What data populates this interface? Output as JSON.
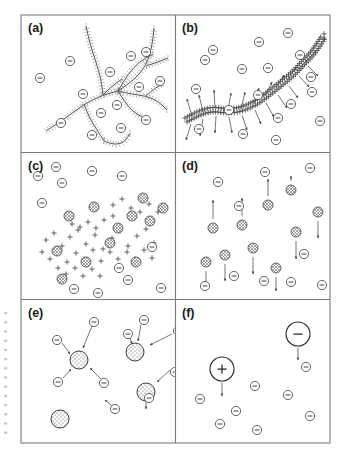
{
  "figure": {
    "name": "polyelectrolyte-complexation-schematic",
    "width": 350,
    "height": 457,
    "background_color": "#ffffff",
    "frame_color": "#7a7a7a",
    "ink_color": "#3a3a3a"
  },
  "layout": {
    "grid": {
      "columns": 2,
      "rows": 3
    },
    "frame": {
      "x": 21,
      "y": 15,
      "width": 309,
      "height": 428
    },
    "divider_x": 175.5,
    "divider_y1": 152.5,
    "divider_y2": 299.5,
    "panel_boxes": [
      {
        "id": "a",
        "x": 21,
        "y": 15,
        "width": 154.5,
        "height": 137.5
      },
      {
        "id": "b",
        "x": 175.5,
        "y": 15,
        "width": 154.5,
        "height": 137.5
      },
      {
        "id": "c",
        "x": 21,
        "y": 152.5,
        "width": 154.5,
        "height": 147
      },
      {
        "id": "d",
        "x": 175.5,
        "y": 152.5,
        "width": 154.5,
        "height": 147
      },
      {
        "id": "e",
        "x": 21,
        "y": 299.5,
        "width": 154.5,
        "height": 143.5
      },
      {
        "id": "f",
        "x": 175.5,
        "y": 299.5,
        "width": 154.5,
        "height": 143.5
      }
    ]
  },
  "panels": [
    {
      "id": "a",
      "label": "(a)",
      "label_x": 28,
      "label_y": 32,
      "description": "branched polyelectrolyte network with charged side groups, surrounded by free negative counterions",
      "content_type": "branched-network"
    },
    {
      "id": "b",
      "label": "(b)",
      "label_x": 182,
      "label_y": 32,
      "description": "single extended chain densely decorated with positive charges, arrows indicating counterion attraction, negative ions in solution",
      "content_type": "extended-chain-with-arrows"
    },
    {
      "id": "c",
      "label": "(c)",
      "label_x": 28,
      "label_y": 170,
      "description": "fragmented chain breaking into charged segments with partially formed complexes and free negative ions",
      "content_type": "fragmenting-cluster"
    },
    {
      "id": "d",
      "label": "(d)",
      "label_x": 182,
      "label_y": 170,
      "description": "dispersed neutral complexes each carrying a vertical migration arrow, with remaining free negative ions",
      "content_type": "dispersed-complexes"
    },
    {
      "id": "e",
      "label": "(e)",
      "label_x": 28,
      "label_y": 317,
      "description": "large stippled colloidal complexes attracting negative counterions along radial arrows",
      "content_type": "colloid-attraction"
    },
    {
      "id": "f",
      "label": "(f)",
      "label_x": 182,
      "label_y": 317,
      "description": "isolated large positive and large negative macroions each with a downward sedimentation arrow among free negative ions",
      "content_type": "macroion-sedimentation"
    }
  ],
  "glyphs": {
    "negative_ion": {
      "symbol": "minus-in-circle",
      "radius": 4.6,
      "label": "⊖"
    },
    "positive_charge": {
      "symbol": "plus-mark",
      "size": 2.6,
      "label": "+"
    },
    "complex_particle": {
      "symbol": "hatched-circle",
      "radius": 5.0
    },
    "colloid_particle": {
      "symbol": "stippled-circle",
      "radius": 9.0
    },
    "macroion_positive": {
      "symbol": "large-circle-plus",
      "radius": 12.0,
      "label": "+"
    },
    "macroion_negative": {
      "symbol": "large-circle-minus",
      "radius": 12.0,
      "label": "−"
    }
  },
  "geometry": {
    "a_ions": [
      [
        40,
        78
      ],
      [
        70,
        61
      ],
      [
        83,
        94
      ],
      [
        110,
        72
      ],
      [
        131,
        56
      ],
      [
        117,
        105
      ],
      [
        146,
        52
      ],
      [
        139,
        87
      ],
      [
        160,
        81
      ],
      [
        121,
        128
      ],
      [
        61,
        123
      ],
      [
        146,
        120
      ],
      [
        101,
        113
      ],
      [
        92,
        135
      ]
    ],
    "a_branches": [
      [
        [
          46,
          131
        ],
        [
          66,
          118
        ],
        [
          84,
          104
        ],
        [
          103,
          95
        ],
        [
          118,
          91
        ]
      ],
      [
        [
          118,
          91
        ],
        [
          134,
          80
        ],
        [
          146,
          66
        ],
        [
          152,
          47
        ],
        [
          154,
          28
        ]
      ],
      [
        [
          118,
          91
        ],
        [
          131,
          94
        ],
        [
          146,
          96
        ],
        [
          158,
          101
        ],
        [
          167,
          110
        ]
      ],
      [
        [
          103,
          95
        ],
        [
          101,
          79
        ],
        [
          96,
          62
        ],
        [
          90,
          44
        ],
        [
          86,
          26
        ]
      ],
      [
        [
          118,
          91
        ],
        [
          128,
          74
        ],
        [
          140,
          61
        ],
        [
          153,
          54
        ]
      ],
      [
        [
          84,
          104
        ],
        [
          89,
          117
        ],
        [
          97,
          130
        ],
        [
          104,
          141
        ]
      ],
      [
        [
          104,
          141
        ],
        [
          115,
          145
        ],
        [
          125,
          142
        ],
        [
          130,
          133
        ]
      ],
      [
        [
          118,
          91
        ],
        [
          125,
          102
        ],
        [
          132,
          111
        ],
        [
          142,
          117
        ]
      ],
      [
        [
          103,
          95
        ],
        [
          112,
          86
        ],
        [
          122,
          79
        ]
      ],
      [
        [
          146,
          66
        ],
        [
          158,
          62
        ],
        [
          168,
          58
        ]
      ],
      [
        [
          146,
          96
        ],
        [
          155,
          88
        ],
        [
          163,
          84
        ]
      ]
    ],
    "b_ions": [
      [
        213,
        50
      ],
      [
        242,
        69
      ],
      [
        196,
        89
      ],
      [
        259,
        42
      ],
      [
        268,
        68
      ],
      [
        288,
        33
      ],
      [
        300,
        55
      ],
      [
        311,
        77
      ],
      [
        229,
        110
      ],
      [
        278,
        118
      ],
      [
        199,
        129
      ],
      [
        243,
        134
      ],
      [
        291,
        104
      ],
      [
        312,
        92
      ],
      [
        258,
        95
      ],
      [
        320,
        121
      ],
      [
        205,
        60
      ],
      [
        276,
        140
      ]
    ],
    "b_chain": [
      [
        186,
        120
      ],
      [
        199,
        113
      ],
      [
        212,
        109
      ],
      [
        226,
        111
      ],
      [
        239,
        110
      ],
      [
        252,
        105
      ],
      [
        263,
        98
      ],
      [
        273,
        90
      ],
      [
        283,
        82
      ],
      [
        294,
        73
      ],
      [
        303,
        63
      ],
      [
        312,
        54
      ],
      [
        319,
        44
      ],
      [
        324,
        36
      ]
    ],
    "b_arrows": [
      [
        [
          192,
          116
        ],
        [
          187,
          99
        ]
      ],
      [
        [
          203,
          112
        ],
        [
          199,
          95
        ]
      ],
      [
        [
          215,
          108
        ],
        [
          214,
          90
        ]
      ],
      [
        [
          228,
          110
        ],
        [
          231,
          93
        ]
      ],
      [
        [
          241,
          109
        ],
        [
          245,
          92
        ]
      ],
      [
        [
          254,
          104
        ],
        [
          259,
          88
        ]
      ],
      [
        [
          265,
          96
        ],
        [
          272,
          82
        ]
      ],
      [
        [
          276,
          88
        ],
        [
          284,
          75
        ]
      ],
      [
        [
          287,
          80
        ],
        [
          296,
          68
        ]
      ],
      [
        [
          297,
          70
        ],
        [
          307,
          60
        ]
      ],
      [
        [
          306,
          61
        ],
        [
          316,
          51
        ]
      ],
      [
        [
          191,
          124
        ],
        [
          186,
          140
        ]
      ],
      [
        [
          203,
          119
        ],
        [
          200,
          136
        ]
      ],
      [
        [
          216,
          116
        ],
        [
          215,
          133
        ]
      ],
      [
        [
          229,
          117
        ],
        [
          232,
          133
        ]
      ],
      [
        [
          242,
          115
        ],
        [
          247,
          130
        ]
      ],
      [
        [
          255,
          110
        ],
        [
          261,
          124
        ]
      ],
      [
        [
          266,
          103
        ],
        [
          274,
          117
        ]
      ],
      [
        [
          278,
          95
        ],
        [
          287,
          108
        ]
      ],
      [
        [
          289,
          86
        ],
        [
          298,
          98
        ]
      ],
      [
        [
          299,
          76
        ],
        [
          309,
          87
        ]
      ],
      [
        [
          308,
          66
        ],
        [
          318,
          76
        ]
      ]
    ],
    "c_ions": [
      [
        38,
        176
      ],
      [
        62,
        183
      ],
      [
        92,
        171
      ],
      [
        122,
        176
      ],
      [
        42,
        203
      ],
      [
        152,
        247
      ],
      [
        128,
        280
      ],
      [
        74,
        289
      ],
      [
        98,
        293
      ],
      [
        119,
        268
      ],
      [
        161,
        288
      ],
      [
        56,
        167
      ]
    ],
    "c_complexes": [
      [
        69,
        216
      ],
      [
        94,
        207
      ],
      [
        118,
        228
      ],
      [
        143,
        198
      ],
      [
        150,
        221
      ],
      [
        57,
        251
      ],
      [
        86,
        262
      ],
      [
        110,
        243
      ],
      [
        136,
        262
      ],
      [
        62,
        279
      ],
      [
        163,
        208
      ],
      [
        132,
        216
      ]
    ],
    "c_pluses": [
      [
        46,
        240
      ],
      [
        54,
        233
      ],
      [
        62,
        246
      ],
      [
        70,
        237
      ],
      [
        78,
        230
      ],
      [
        86,
        244
      ],
      [
        95,
        235
      ],
      [
        103,
        249
      ],
      [
        112,
        238
      ],
      [
        120,
        231
      ],
      [
        128,
        246
      ],
      [
        137,
        236
      ],
      [
        146,
        229
      ],
      [
        154,
        243
      ],
      [
        42,
        252
      ],
      [
        50,
        259
      ],
      [
        59,
        252
      ],
      [
        67,
        262
      ],
      [
        76,
        253
      ],
      [
        84,
        259
      ],
      [
        93,
        250
      ],
      [
        101,
        261
      ],
      [
        110,
        252
      ],
      [
        118,
        259
      ],
      [
        127,
        252
      ],
      [
        135,
        259
      ],
      [
        144,
        250
      ],
      [
        152,
        258
      ],
      [
        58,
        268
      ],
      [
        66,
        274
      ],
      [
        75,
        268
      ],
      [
        83,
        276
      ],
      [
        92,
        269
      ],
      [
        100,
        276
      ],
      [
        113,
        205
      ],
      [
        122,
        199
      ],
      [
        131,
        208
      ],
      [
        140,
        212
      ],
      [
        149,
        204
      ],
      [
        158,
        212
      ],
      [
        104,
        220
      ],
      [
        113,
        216
      ],
      [
        96,
        228
      ],
      [
        88,
        222
      ],
      [
        80,
        227
      ],
      [
        72,
        224
      ]
    ],
    "d_ions": [
      [
        218,
        182
      ],
      [
        265,
        172
      ],
      [
        310,
        168
      ],
      [
        239,
        206
      ],
      [
        304,
        254
      ],
      [
        264,
        281
      ],
      [
        291,
        282
      ],
      [
        234,
        276
      ],
      [
        322,
        285
      ],
      [
        205,
        286
      ]
    ],
    "d_complexes": [
      [
        213,
        228
      ],
      [
        242,
        225
      ],
      [
        268,
        205
      ],
      [
        296,
        232
      ],
      [
        253,
        248
      ],
      [
        225,
        255
      ],
      [
        206,
        262
      ],
      [
        291,
        190
      ],
      [
        318,
        212
      ],
      [
        276,
        268
      ]
    ],
    "d_arrows": [
      [
        [
          213,
          219
        ],
        [
          213,
          200
        ]
      ],
      [
        [
          242,
          216
        ],
        [
          242,
          198
        ]
      ],
      [
        [
          268,
          196
        ],
        [
          268,
          179
        ]
      ],
      [
        [
          296,
          241
        ],
        [
          296,
          259
        ]
      ],
      [
        [
          253,
          257
        ],
        [
          253,
          274
        ]
      ],
      [
        [
          225,
          264
        ],
        [
          225,
          281
        ]
      ],
      [
        [
          206,
          271
        ],
        [
          206,
          288
        ]
      ],
      [
        [
          291,
          181
        ],
        [
          291,
          176
        ]
      ],
      [
        [
          318,
          221
        ],
        [
          318,
          238
        ]
      ],
      [
        [
          276,
          277
        ],
        [
          276,
          291
        ]
      ]
    ],
    "e_ions": [
      [
        94,
        322
      ],
      [
        57,
        340
      ],
      [
        58,
        382
      ],
      [
        104,
        383
      ],
      [
        144,
        320
      ],
      [
        128,
        334
      ],
      [
        178,
        331
      ],
      [
        175,
        372
      ],
      [
        115,
        409
      ],
      [
        149,
        398
      ]
    ],
    "e_colloids": [
      [
        79,
        360
      ],
      [
        135,
        352
      ],
      [
        146,
        392
      ],
      [
        60,
        419
      ]
    ],
    "e_arrows": [
      [
        [
          92,
          326
        ],
        [
          83,
          348
        ]
      ],
      [
        [
          62,
          343
        ],
        [
          70,
          354
        ]
      ],
      [
        [
          63,
          378
        ],
        [
          71,
          369
        ]
      ],
      [
        [
          101,
          379
        ],
        [
          90,
          368
        ]
      ],
      [
        [
          141,
          325
        ],
        [
          138,
          341
        ]
      ],
      [
        [
          130,
          338
        ],
        [
          132,
          344
        ]
      ],
      [
        [
          172,
          334
        ],
        [
          150,
          345
        ]
      ],
      [
        [
          170,
          370
        ],
        [
          157,
          382
        ]
      ],
      [
        [
          112,
          406
        ],
        [
          105,
          400
        ]
      ],
      [
        [
          146,
          401
        ],
        [
          146,
          409
        ]
      ]
    ],
    "f_ions": [
      [
        255,
        386
      ],
      [
        288,
        395
      ],
      [
        306,
        367
      ],
      [
        310,
        416
      ],
      [
        257,
        430
      ],
      [
        220,
        424
      ],
      [
        236,
        411
      ],
      [
        200,
        399
      ]
    ],
    "f_macroions": [
      {
        "x": 222,
        "y": 369,
        "sign": "+",
        "arrow_to": [
          222,
          396
        ]
      },
      {
        "x": 298,
        "y": 334,
        "sign": "−",
        "arrow_to": [
          298,
          360
        ]
      }
    ]
  }
}
